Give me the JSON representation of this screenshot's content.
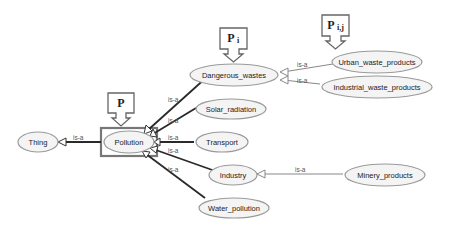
{
  "diagram": {
    "nodes": {
      "thing": "Thing",
      "pollution": "Pollution",
      "dangerous_wastes": "Dangerous_wastes",
      "solar_radiation": "Solar_radiation",
      "transport": "Transport",
      "industry": "Industry",
      "water_pollution": "Water_pollution",
      "urban_waste_products": "Urban_waste_products",
      "industrial_waste_products": "Industrial_waste_products",
      "minery_products": "Minery_products"
    },
    "edge_label": "is-a",
    "markers": {
      "p": {
        "base": "P",
        "sub": ""
      },
      "pi": {
        "base": "P",
        "sub": "i"
      },
      "pij": {
        "base": "P",
        "sub": "i,j"
      }
    }
  }
}
